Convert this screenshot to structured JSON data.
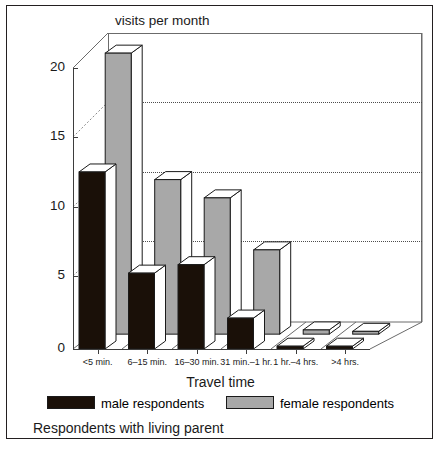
{
  "chart_data": {
    "type": "bar",
    "title": "visits per month",
    "xlabel": "Travel time",
    "ylabel": "visits per month",
    "caption": "Respondents with living parent",
    "categories": [
      "<5 min.",
      "6–15 min.",
      "16–30 min.",
      "31 min.–1 hr.",
      "1 hr.–4 hrs.",
      ">4 hrs."
    ],
    "series": [
      {
        "name": "male respondents",
        "color": "#1a1008",
        "values": [
          12.6,
          5.4,
          6.0,
          2.2,
          0.2,
          0.2
        ]
      },
      {
        "name": "female respondents",
        "color": "#a8a8a8",
        "values": [
          20.0,
          11.0,
          9.7,
          6.0,
          0.3,
          0.2
        ]
      }
    ],
    "ylim": [
      0,
      21.5
    ],
    "yticks": [
      0,
      5,
      10,
      15,
      20
    ],
    "ytick_labels": [
      "0",
      "5",
      "10",
      "15",
      "20"
    ],
    "gridlines": [
      5,
      10,
      15
    ],
    "grid": "dotted-horizontal",
    "legend_position": "bottom",
    "style": "3d-grouped-bars"
  },
  "legend": {
    "male_label": "male respondents",
    "female_label": "female respondents"
  }
}
